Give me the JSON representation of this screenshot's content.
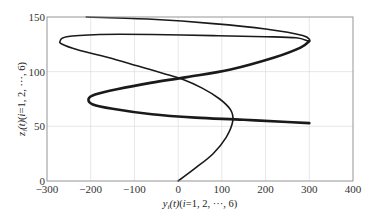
{
  "chart_data": {
    "type": "line",
    "title": "",
    "xlabel": "y_i(t)(i=1, 2, ···, 6)",
    "ylabel": "z_i(t)(i=1, 2, ···, 6)",
    "xlim": [
      -300,
      400
    ],
    "ylim": [
      0,
      150
    ],
    "x_ticks": [
      -300,
      -200,
      -100,
      0,
      100,
      200,
      300,
      400
    ],
    "y_ticks": [
      0,
      50,
      100,
      150
    ],
    "grid": true,
    "legend": null,
    "series": [
      {
        "name": "trajectory (6 overlapping agents)",
        "points": [
          [
            0,
            0
          ],
          [
            40,
            12
          ],
          [
            80,
            25
          ],
          [
            110,
            40
          ],
          [
            125,
            55
          ],
          [
            120,
            65
          ],
          [
            95,
            75
          ],
          [
            55,
            85
          ],
          [
            10,
            93
          ],
          [
            -30,
            98
          ],
          [
            -90,
            105
          ],
          [
            -160,
            113
          ],
          [
            -230,
            120
          ],
          [
            -265,
            125
          ],
          [
            -270,
            128
          ],
          [
            -255,
            132
          ],
          [
            -180,
            134
          ],
          [
            -60,
            134
          ],
          [
            80,
            133
          ],
          [
            200,
            132
          ],
          [
            270,
            131
          ],
          [
            300,
            128
          ],
          [
            285,
            133
          ],
          [
            200,
            139
          ],
          [
            80,
            144
          ],
          [
            -60,
            148
          ],
          [
            -210,
            150
          ]
        ],
        "width": "thin"
      },
      {
        "name": "trajectory (thick overlapping band)",
        "points": [
          [
            300,
            128
          ],
          [
            280,
            122
          ],
          [
            220,
            113
          ],
          [
            120,
            102
          ],
          [
            20,
            95
          ],
          [
            -60,
            90
          ],
          [
            -140,
            84
          ],
          [
            -190,
            79
          ],
          [
            -205,
            75
          ],
          [
            -195,
            70
          ],
          [
            -150,
            66
          ],
          [
            -60,
            61
          ],
          [
            40,
            58
          ],
          [
            150,
            56
          ],
          [
            250,
            54
          ],
          [
            300,
            53
          ]
        ],
        "width": "thick"
      }
    ]
  },
  "axes": {
    "x_tick_labels": [
      "−300",
      "−200",
      "−100",
      "0",
      "100",
      "200",
      "300",
      "400"
    ],
    "y_tick_labels": [
      "0",
      "50",
      "100",
      "150"
    ],
    "xlabel_parts": {
      "var": "y",
      "sub": "i",
      "rest": "(t)(",
      "i": "i",
      "eq": "=1, 2, ···, 6)"
    },
    "ylabel_parts": {
      "var": "z",
      "sub": "i",
      "rest": "(t)(",
      "i": "i",
      "eq": "=1, 2, ···, 6)"
    }
  }
}
